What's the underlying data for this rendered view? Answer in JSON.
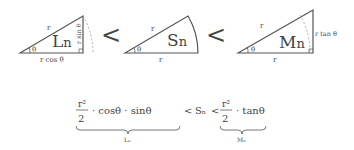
{
  "figures": {
    "inner_triangle": {
      "area_label": "L",
      "area_sub": "n",
      "hyp_label": "r",
      "vertical_label": "r sin θ",
      "base_label": "r cos θ",
      "angle_label": "θ"
    },
    "sector": {
      "area_label": "S",
      "area_sub": "n",
      "radius_top_label": "r",
      "radius_bottom_label": "r",
      "angle_label": "θ"
    },
    "outer_triangle": {
      "area_label": "M",
      "area_sub": "n",
      "hyp_label": "r",
      "vertical_label": "r tan θ",
      "base_label": "r",
      "angle_label": "θ"
    },
    "less_than_1": "<",
    "less_than_2": "<"
  },
  "formula": {
    "left_num": "r²",
    "left_den": "2",
    "left_rest": "· cosθ · sinθ",
    "left_brace_label": "Lₙ",
    "middle_lt1": "<",
    "middle": "Sₙ",
    "middle_lt2": "<",
    "right_num": "r²",
    "right_den": "2",
    "right_rest": "· tanθ",
    "right_brace_label": "Mₙ"
  }
}
